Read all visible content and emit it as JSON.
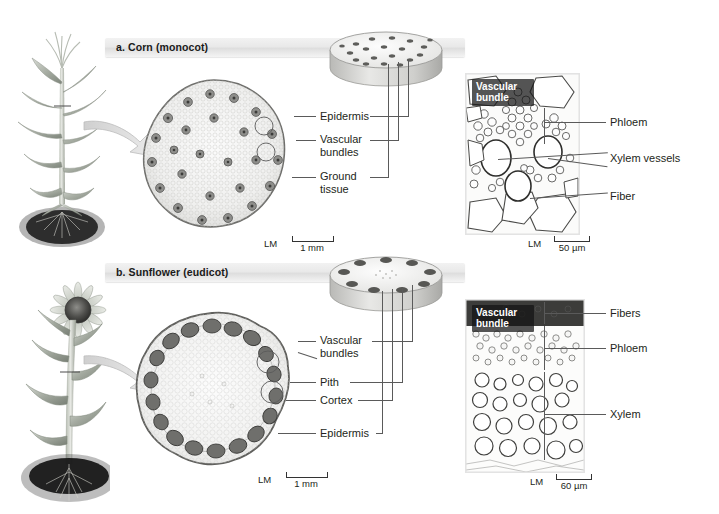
{
  "figure": {
    "background": "#ffffff",
    "leader_color": "#5a5a5a"
  },
  "panels": [
    {
      "id": "a",
      "label": "a. Corn (monocot)",
      "plant_name": "corn-plant",
      "arrangement": "scattered",
      "drawing": {
        "name": "corn-stem-cross-section",
        "scale": {
          "method": "LM",
          "value": "1 mm"
        }
      },
      "cylinder": {
        "name": "corn-stem-cylinder",
        "bundle_count": 22
      },
      "callouts": [
        {
          "text": "Epidermis"
        },
        {
          "text": "Vascular bundles"
        },
        {
          "text": "Ground tissue"
        }
      ],
      "micrograph": {
        "name": "corn-vascular-bundle-micrograph",
        "badge": "Vascular bundle",
        "scale": {
          "method": "LM",
          "value": "50 µm"
        },
        "callouts": [
          {
            "text": "Phloem"
          },
          {
            "text": "Xylem vessels"
          },
          {
            "text": "Fiber"
          }
        ]
      }
    },
    {
      "id": "b",
      "label": "b. Sunflower (eudicot)",
      "plant_name": "sunflower-plant",
      "arrangement": "ring",
      "drawing": {
        "name": "sunflower-stem-cross-section",
        "scale": {
          "method": "LM",
          "value": "1 mm"
        }
      },
      "cylinder": {
        "name": "sunflower-stem-cylinder",
        "bundle_count": 9
      },
      "callouts": [
        {
          "text": "Vascular bundles"
        },
        {
          "text": "Pith"
        },
        {
          "text": "Cortex"
        },
        {
          "text": "Epidermis"
        }
      ],
      "micrograph": {
        "name": "sunflower-vascular-bundle-micrograph",
        "badge": "Vascular bundle",
        "scale": {
          "method": "LM",
          "value": "60 µm"
        },
        "callouts": [
          {
            "text": "Fibers"
          },
          {
            "text": "Phloem"
          },
          {
            "text": "Xylem"
          }
        ]
      }
    }
  ]
}
